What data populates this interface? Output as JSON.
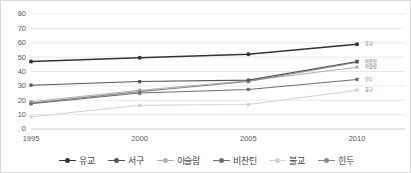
{
  "chart_data": {
    "type": "line",
    "title": "",
    "subtitle": "",
    "xlabel": "",
    "ylabel": "",
    "categories": [
      "1995",
      "2000",
      "2005",
      "2010"
    ],
    "x": [
      1995,
      2000,
      2005,
      2010
    ],
    "ylim": [
      0,
      80
    ],
    "yticks": [
      0,
      10,
      20,
      30,
      40,
      50,
      60,
      70,
      80
    ],
    "grid": true,
    "legend_position": "bottom",
    "series": [
      {
        "name": "유교",
        "values": [
          47.0,
          49.5,
          52.0,
          59.0
        ],
        "color": "#333333",
        "end_label": "유교"
      },
      {
        "name": "서구",
        "values": [
          30.5,
          33.0,
          34.0,
          47.0
        ],
        "color": "#555555",
        "end_label": "비잔틴"
      },
      {
        "name": "이슬람",
        "values": [
          19.0,
          27.0,
          33.5,
          43.0
        ],
        "color": "#b0b0b0",
        "end_label": "이슬람"
      },
      {
        "name": "비잔틴",
        "values": [
          17.5,
          25.0,
          27.5,
          34.5
        ],
        "color": "#6e6e6e",
        "end_label": "힌두"
      },
      {
        "name": "불교",
        "values": [
          8.5,
          16.5,
          17.0,
          27.0
        ],
        "color": "#d2d2d2",
        "end_label": "불교"
      },
      {
        "name": "힌두",
        "values": [
          18.0,
          26.0,
          33.0,
          46.5
        ],
        "color": "#8a8a8a",
        "end_label": ""
      }
    ]
  },
  "axis": {
    "y_tick_labels": [
      "80",
      "70",
      "60",
      "50",
      "40",
      "30",
      "20",
      "10",
      "0"
    ],
    "x_tick_labels": [
      "1995",
      "2000",
      "2005",
      "2010"
    ]
  },
  "legend": {
    "items": [
      {
        "label": "유교",
        "color": "#333333"
      },
      {
        "label": "서구",
        "color": "#555555"
      },
      {
        "label": "이슬람",
        "color": "#b0b0b0"
      },
      {
        "label": "비잔틴",
        "color": "#6e6e6e"
      },
      {
        "label": "불교",
        "color": "#d2d2d2"
      },
      {
        "label": "힌두",
        "color": "#8a8a8a"
      }
    ]
  },
  "end_labels": [
    {
      "label": "유교",
      "value": 59.0
    },
    {
      "label": "비잔틴",
      "value": 47.0
    },
    {
      "label": "이슬람",
      "value": 43.0
    },
    {
      "label": "힌두",
      "value": 34.5
    },
    {
      "label": "불교",
      "value": 27.0
    }
  ],
  "colors": {
    "grid": "#e3e3e3",
    "axis": "#c9c9c9",
    "border": "#d8d8d8",
    "tick_text": "#595959",
    "background": "#ffffff"
  }
}
